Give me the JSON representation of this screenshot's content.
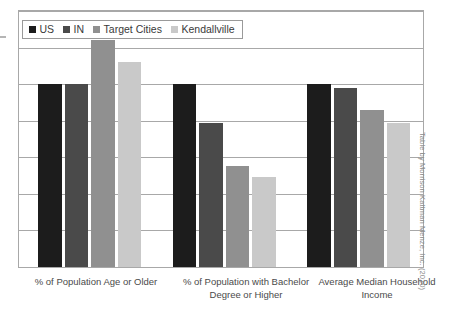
{
  "chart_data": {
    "type": "bar",
    "title": "",
    "subtitle": "",
    "xlabel": "",
    "ylabel": "",
    "grid": true,
    "legend_position": "top-left",
    "axis_tick_labels": [],
    "ylim": [
      0,
      140
    ],
    "gridline_values": [
      0,
      20,
      40,
      60,
      80,
      100,
      120,
      140
    ],
    "categories": [
      "% of Population Age or Older",
      "% of Population with Bachelor Degree or Higher",
      "Average Median Household Income"
    ],
    "series": [
      {
        "name": "US",
        "color": "#1c1c1c",
        "values": [
          100,
          100,
          100
        ]
      },
      {
        "name": "IN",
        "color": "#4a4a4a",
        "values": [
          100,
          79,
          98
        ]
      },
      {
        "name": "Target Cities",
        "color": "#909090",
        "values": [
          124,
          55,
          86
        ]
      },
      {
        "name": "Kendallville",
        "color": "#c9c9c9",
        "values": [
          112,
          49,
          79
        ]
      }
    ],
    "annotations": [
      "Table by Morrison Kattman Menze, Inc. (2010)"
    ]
  },
  "legend": {
    "items": [
      {
        "label": "US",
        "color": "#1c1c1c"
      },
      {
        "label": "IN",
        "color": "#4a4a4a"
      },
      {
        "label": "Target Cities",
        "color": "#909090"
      },
      {
        "label": "Kendallville",
        "color": "#c9c9c9"
      }
    ]
  },
  "credit": {
    "text": "Table by Morrison Kattman Menze, Inc. (2010)"
  },
  "colors": {
    "grid": "#a8a8a8",
    "frame": "#a8a8a8",
    "text": "#4a4a4a",
    "credit": "#8c8c8c",
    "background": "#ffffff"
  }
}
